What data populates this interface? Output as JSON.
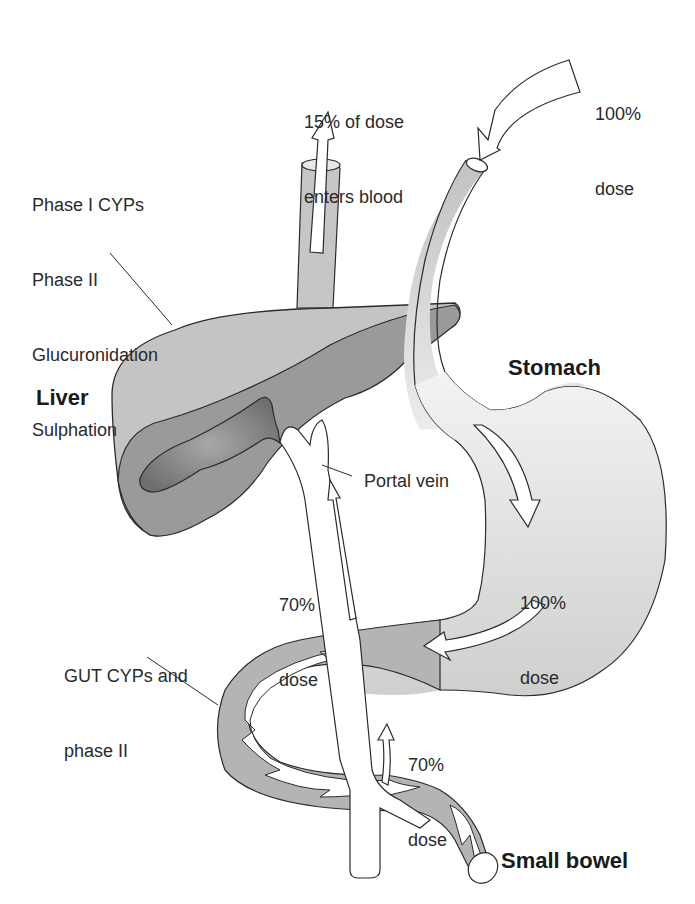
{
  "labels": {
    "dose_in": [
      "100%",
      "dose"
    ],
    "enters_blood": [
      "15% of dose",
      "enters blood"
    ],
    "liver_enzymes": [
      "Phase I CYPs",
      "Phase II",
      "Glucuronidation",
      "Sulphation"
    ],
    "liver": "Liver",
    "stomach": "Stomach",
    "portal_vein": "Portal vein",
    "portal_dose": [
      "70%",
      "dose"
    ],
    "stomach_dose": [
      "100%",
      "dose"
    ],
    "gut_enzymes": [
      "GUT CYPs and",
      "phase II"
    ],
    "bowel_dose": [
      "70%",
      "dose"
    ],
    "small_bowel": "Small bowel"
  },
  "colors": {
    "background": "#ffffff",
    "outline": "#2b2b2b",
    "liver_light": "#c4c4c4",
    "liver_dark": "#8e8e8e",
    "gallbladder": "#7a7a7a",
    "stomach": "#d2d2d2",
    "bowel": "#b4b4b4",
    "vessel": "#c8c8c8",
    "arrow_fill": "#ffffff",
    "text": "#2a2a2a"
  }
}
